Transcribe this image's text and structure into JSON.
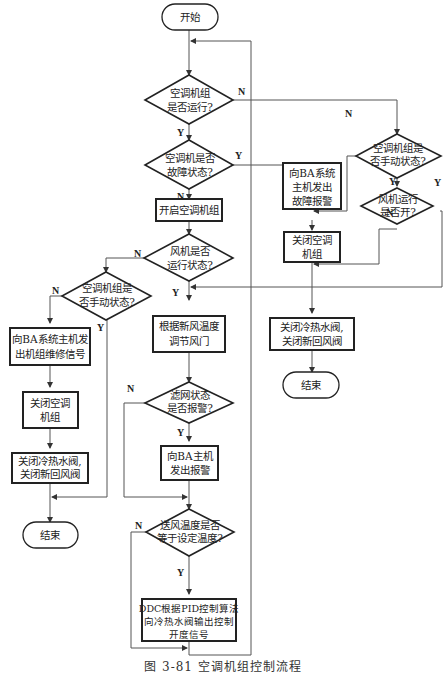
{
  "diagram": {
    "type": "flowchart",
    "caption": "图 3-81   空调机组控制流程",
    "nodes": {
      "start": {
        "shape": "terminal",
        "lines": [
          "开始"
        ]
      },
      "d_running": {
        "shape": "decision",
        "lines": [
          "空调机组",
          "是否运行?"
        ]
      },
      "d_fault": {
        "shape": "decision",
        "lines": [
          "空调机是否",
          "故障状态?"
        ]
      },
      "p_start_unit": {
        "shape": "process",
        "lines": [
          "开启空调机组"
        ]
      },
      "d_fan_running": {
        "shape": "decision",
        "lines": [
          "风机是否",
          "运行状态?"
        ]
      },
      "d_manual_left": {
        "shape": "decision",
        "lines": [
          "空调机组是",
          "否手动状态?"
        ]
      },
      "p_send_maint": {
        "shape": "process",
        "lines": [
          "向BA系统主机发",
          "出机组维修信号"
        ]
      },
      "p_close_unit_left": {
        "shape": "process",
        "lines": [
          "关闭空调",
          "机组"
        ]
      },
      "p_close_valves_left": {
        "shape": "process",
        "lines": [
          "关闭冷热水阀,",
          "关闭新回风阀"
        ]
      },
      "end_left": {
        "shape": "terminal",
        "lines": [
          "结束"
        ]
      },
      "p_adjust_damper": {
        "shape": "process",
        "lines": [
          "根据新风温度",
          "调节风门"
        ]
      },
      "d_filter_alarm": {
        "shape": "decision",
        "lines": [
          "滤网状态",
          "是否报警?"
        ]
      },
      "p_alarm_ba": {
        "shape": "process",
        "lines": [
          "向BA主机",
          "发出报警"
        ]
      },
      "d_supply_temp": {
        "shape": "decision",
        "lines": [
          "送风温度是否",
          "等于设定温度?"
        ]
      },
      "p_ddc_pid": {
        "shape": "process",
        "lines": [
          "DDC根据PID控制算法",
          "向冷热水阀输出控制",
          "开度信号"
        ]
      },
      "p_fault_alarm": {
        "shape": "process",
        "lines": [
          "向BA系统",
          "主机发出",
          "故障报警"
        ]
      },
      "p_close_unit_mid": {
        "shape": "process",
        "lines": [
          "关闭空调",
          "机组"
        ]
      },
      "d_manual_right": {
        "shape": "decision",
        "lines": [
          "空调机组是",
          "否手动状态?"
        ]
      },
      "d_fan_open": {
        "shape": "decision",
        "lines": [
          "风机运行",
          "是否开?"
        ]
      },
      "p_close_valves_mid": {
        "shape": "process",
        "lines": [
          "关闭冷热水阀,",
          "关闭新回风阀"
        ]
      },
      "end_mid": {
        "shape": "terminal",
        "lines": [
          "结束"
        ]
      }
    },
    "edges": [
      {
        "from": "start",
        "to": "d_running"
      },
      {
        "from": "d_running",
        "to": "d_fault",
        "label": "Y"
      },
      {
        "from": "d_running",
        "to": "d_manual_right",
        "label": "N"
      },
      {
        "from": "d_fault",
        "to": "p_start_unit",
        "label": "N"
      },
      {
        "from": "d_fault",
        "to": "p_fault_alarm",
        "label": "Y"
      },
      {
        "from": "p_start_unit",
        "to": "d_fan_running"
      },
      {
        "from": "d_fan_running",
        "to": "p_adjust_damper",
        "label": "Y"
      },
      {
        "from": "d_fan_running",
        "to": "d_manual_left",
        "label": "N"
      },
      {
        "from": "d_manual_left",
        "to": "p_send_maint",
        "label": "N"
      },
      {
        "from": "d_manual_left",
        "to": "end_left",
        "label": "Y"
      },
      {
        "from": "p_send_maint",
        "to": "p_close_unit_left"
      },
      {
        "from": "p_close_unit_left",
        "to": "p_close_valves_left"
      },
      {
        "from": "p_close_valves_left",
        "to": "end_left"
      },
      {
        "from": "p_adjust_damper",
        "to": "d_filter_alarm"
      },
      {
        "from": "d_filter_alarm",
        "to": "p_alarm_ba",
        "label": "Y"
      },
      {
        "from": "d_filter_alarm",
        "to": "d_supply_temp",
        "label": "N"
      },
      {
        "from": "p_alarm_ba",
        "to": "d_supply_temp"
      },
      {
        "from": "d_supply_temp",
        "to": "p_ddc_pid",
        "label": "Y"
      },
      {
        "from": "d_supply_temp",
        "to": "d_running",
        "label": "N"
      },
      {
        "from": "p_ddc_pid",
        "to": "d_running"
      },
      {
        "from": "p_fault_alarm",
        "to": "p_close_unit_mid"
      },
      {
        "from": "d_manual_right",
        "to": "p_close_unit_mid",
        "label": "N"
      },
      {
        "from": "d_manual_right",
        "to": "d_fan_open",
        "label": "Y"
      },
      {
        "from": "d_fan_open",
        "to": "p_close_unit_mid",
        "label": "N"
      },
      {
        "from": "d_fan_open",
        "to": "p_adjust_damper",
        "label": "Y"
      },
      {
        "from": "p_close_unit_mid",
        "to": "p_close_valves_mid"
      },
      {
        "from": "p_close_valves_mid",
        "to": "end_mid"
      }
    ],
    "labels": {
      "yes": "Y",
      "no": "N"
    }
  }
}
